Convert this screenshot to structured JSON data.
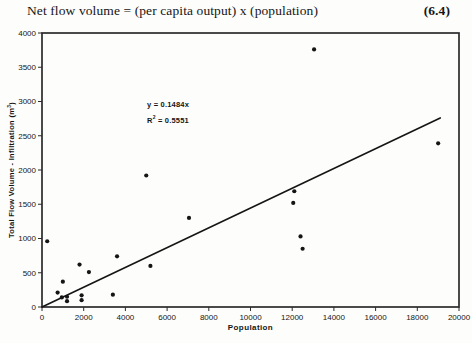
{
  "page": {
    "equation_text": "Net flow volume = (per capita output) x  (population)",
    "equation_number": "(6.4)"
  },
  "chart_data": {
    "type": "scatter",
    "title": "",
    "xlabel": "Population",
    "ylabel": "Total Flow Volume - Infiltration (m³)",
    "ylabel_parts": {
      "main": "Total Flow Volume - Infiltration (m",
      "sup": "3",
      "close": ")"
    },
    "xlim": [
      0,
      20000
    ],
    "ylim": [
      0,
      4000
    ],
    "x_ticks": [
      0,
      2000,
      4000,
      6000,
      8000,
      10000,
      12000,
      14000,
      16000,
      18000,
      20000
    ],
    "y_ticks": [
      0,
      500,
      1000,
      1500,
      2000,
      2500,
      3000,
      3500,
      4000
    ],
    "grid": false,
    "legend": false,
    "points": [
      [
        250,
        960
      ],
      [
        750,
        210
      ],
      [
        950,
        140
      ],
      [
        1000,
        370
      ],
      [
        1200,
        150
      ],
      [
        1200,
        85
      ],
      [
        1800,
        620
      ],
      [
        1900,
        170
      ],
      [
        1900,
        100
      ],
      [
        2250,
        510
      ],
      [
        3400,
        180
      ],
      [
        3600,
        740
      ],
      [
        5000,
        1920
      ],
      [
        5200,
        600
      ],
      [
        7050,
        1300
      ],
      [
        12050,
        1520
      ],
      [
        12100,
        1690
      ],
      [
        12400,
        1030
      ],
      [
        12500,
        850
      ],
      [
        13050,
        3760
      ],
      [
        19000,
        2390
      ]
    ],
    "trendline": {
      "equation": "y = 0.1484x",
      "r2_prefix": "R",
      "r2_sup": "2",
      "r2_rest": " = 0.5551",
      "x_start": 0,
      "y_start": 0,
      "x_end": 19100,
      "y_end": 2760
    }
  },
  "colors": {
    "ink": "#151515",
    "frame": "#2b2b2b",
    "background": "#fdfdfc"
  }
}
